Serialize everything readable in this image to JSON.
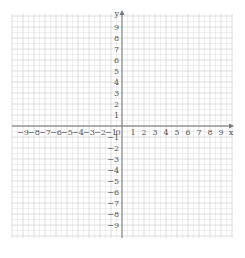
{
  "diagram": {
    "type": "coordinate-plane",
    "x_axis": {
      "label": "x",
      "min": -9,
      "max": 9,
      "ticks": [
        -9,
        -8,
        -7,
        -6,
        -5,
        -4,
        -3,
        -2,
        -1,
        1,
        2,
        3,
        4,
        5,
        6,
        7,
        8,
        9
      ]
    },
    "y_axis": {
      "label": "y",
      "min": -9,
      "max": 9,
      "ticks": [
        9,
        8,
        7,
        6,
        5,
        4,
        3,
        2,
        1,
        -1,
        -2,
        -3,
        -4,
        -5,
        -6,
        -7,
        -8,
        -9
      ]
    },
    "origin_label": "0",
    "colors": {
      "grid": "#d6d6d6",
      "axis": "#777777",
      "labels": "#555555",
      "background": "#ffffff"
    }
  }
}
